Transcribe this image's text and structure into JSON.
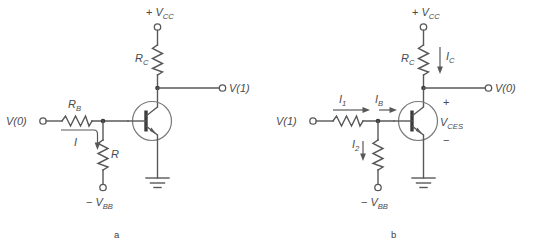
{
  "figure": {
    "background_color": "#ffffff",
    "line_color": "#58585a",
    "text_color": "#4a4a4c",
    "captions": {
      "left": "a",
      "right": "b"
    }
  },
  "circuit_a": {
    "caption": "a",
    "supply_label_sign": "+",
    "supply_label_name": "V",
    "supply_label_sub": "CC",
    "collector_resistor_name": "R",
    "collector_resistor_sub": "C",
    "output_terminal": "V(1)",
    "input_terminal": "V(0)",
    "base_resistor_name": "R",
    "base_resistor_sub": "B",
    "current_label": "I",
    "pulldown_resistor_name": "R",
    "negative_supply_sign": "−",
    "negative_supply_name": "V",
    "negative_supply_sub": "BB",
    "ground": "ground-symbol",
    "transistor": "npn-transistor"
  },
  "circuit_b": {
    "caption": "b",
    "supply_label_sign": "+",
    "supply_label_name": "V",
    "supply_label_sub": "CC",
    "collector_resistor_name": "R",
    "collector_resistor_sub": "C",
    "collector_current_name": "I",
    "collector_current_sub": "C",
    "output_terminal": "V(0)",
    "input_terminal": "V(1)",
    "input_current_name": "I",
    "input_current_sub": "1",
    "base_current_name": "I",
    "base_current_sub": "B",
    "pulldown_current_name": "I",
    "pulldown_current_sub": "2",
    "saturation_voltage_name": "V",
    "saturation_voltage_sub": "CES",
    "plus_sign": "+",
    "minus_sign": "−",
    "negative_supply_sign": "−",
    "negative_supply_name": "V",
    "negative_supply_sub": "BB",
    "ground": "ground-symbol",
    "transistor": "npn-transistor"
  }
}
